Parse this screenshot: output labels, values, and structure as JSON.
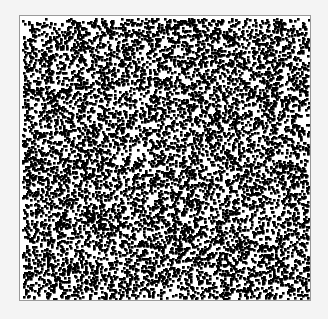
{
  "chart_data": {
    "type": "scatter",
    "title": "",
    "xlabel": "",
    "ylabel": "",
    "grid": false,
    "legend": null,
    "xlim": [
      0,
      1
    ],
    "ylim": [
      0,
      1
    ],
    "point_count": 9000,
    "point_size_px": 2.6,
    "distribution": "uniform",
    "seed": 12345,
    "marker_color": "#000000",
    "background_color": "#ffffff",
    "frame_color": "#9a9a9a"
  }
}
